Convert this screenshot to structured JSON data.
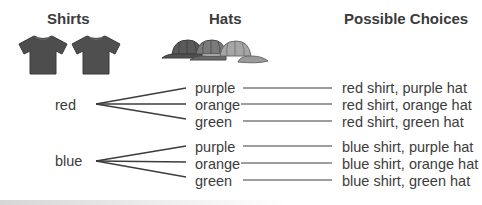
{
  "headers": {
    "shirts": "Shirts",
    "hats": "Hats",
    "choices": "Possible Choices"
  },
  "icons": {
    "shirts": [
      "tshirt-icon",
      "tshirt-icon"
    ],
    "hats": [
      "cap-icon",
      "cap-icon",
      "cap-icon"
    ],
    "colors": {
      "shirt": "#4d4d4d",
      "hat_dark": "#5a5a5a",
      "hat_mid": "#7a7a7a",
      "hat_light": "#a6a6a6",
      "line": "#3c3c3c"
    }
  },
  "tree": [
    {
      "shirt": "red",
      "hats": [
        {
          "hat": "purple",
          "choice": "red shirt, purple hat"
        },
        {
          "hat": "orange",
          "choice": "red shirt, orange hat"
        },
        {
          "hat": "green",
          "choice": "red shirt, green hat"
        }
      ]
    },
    {
      "shirt": "blue",
      "hats": [
        {
          "hat": "purple",
          "choice": "blue shirt, purple hat"
        },
        {
          "hat": "orange",
          "choice": "blue shirt, orange hat"
        },
        {
          "hat": "green",
          "choice": "blue shirt, green hat"
        }
      ]
    }
  ]
}
